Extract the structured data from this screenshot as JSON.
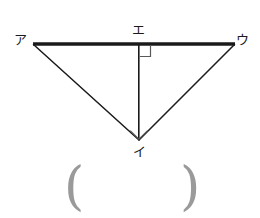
{
  "figure": {
    "background_color": "#ffffff",
    "stroke_color": "#1a1a1a",
    "paren_color": "#9a9a9a",
    "labels": {
      "top_left": "ア",
      "top_right": "ウ",
      "top_middle": "エ",
      "bottom": "イ"
    },
    "answer_blank": {
      "open": "(",
      "close": ")"
    },
    "geometry": {
      "vertices": {
        "top_left": [
          33,
          44
        ],
        "top_right": [
          235,
          44
        ],
        "bottom": [
          139,
          140
        ],
        "foot_of_altitude": [
          139,
          44
        ]
      },
      "edges": [
        {
          "name": "top-edge",
          "from": "top_left",
          "to": "top_right",
          "width": 3.4
        },
        {
          "name": "left-edge",
          "from": "top_left",
          "to": "bottom",
          "width": 1.5
        },
        {
          "name": "right-edge",
          "from": "top_right",
          "to": "bottom",
          "width": 1.5
        },
        {
          "name": "altitude",
          "from": "foot_of_altitude",
          "to": "bottom",
          "width": 1.6
        }
      ],
      "right_angle_marks": [
        {
          "name": "at-foot-of-altitude",
          "style": "square",
          "size": 11
        },
        {
          "name": "at-bottom-vertex",
          "style": "diamond",
          "size": 9
        }
      ]
    }
  }
}
